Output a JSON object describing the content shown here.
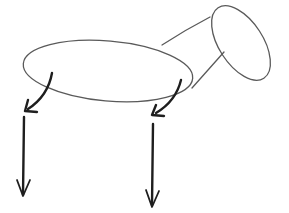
{
  "drawing": {
    "style": "hand-drawn pencil sketch",
    "subject": "simple animal with forces",
    "stroke_colors": {
      "outline": "#5a5a5a",
      "arrows": "#1e1e1e"
    },
    "background": "#ffffff",
    "parts": [
      {
        "name": "body",
        "shape": "ellipse"
      },
      {
        "name": "neck",
        "shape": "two lines"
      },
      {
        "name": "head",
        "shape": "ellipse"
      },
      {
        "name": "front-leg-curved-arrow",
        "shape": "curved arrow"
      },
      {
        "name": "back-leg-curved-arrow",
        "shape": "curved arrow"
      },
      {
        "name": "left-down-arrow",
        "shape": "vertical arrow"
      },
      {
        "name": "right-down-arrow",
        "shape": "vertical arrow"
      }
    ]
  }
}
